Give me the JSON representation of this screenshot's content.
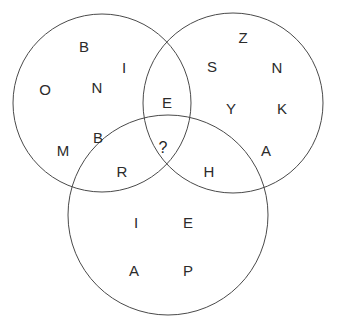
{
  "diagram": {
    "type": "venn",
    "background_color": "#ffffff",
    "stroke_color": "#4a4a4a",
    "text_color": "#2b2b2b",
    "circles": [
      {
        "id": "left",
        "label": "left-circle",
        "cx": 102,
        "cy": 103,
        "r": 89
      },
      {
        "id": "right",
        "label": "right-circle",
        "cx": 233,
        "cy": 103,
        "r": 90
      },
      {
        "id": "bottom",
        "label": "bottom-circle",
        "cx": 168,
        "cy": 215,
        "r": 100
      }
    ],
    "letters": [
      {
        "id": "l1",
        "text": "B",
        "x": 84,
        "y": 48,
        "region": "left-only"
      },
      {
        "id": "l2",
        "text": "I",
        "x": 124,
        "y": 69,
        "region": "left-only"
      },
      {
        "id": "l3",
        "text": "O",
        "x": 45,
        "y": 91,
        "region": "left-only"
      },
      {
        "id": "l4",
        "text": "N",
        "x": 97,
        "y": 89,
        "region": "left-only"
      },
      {
        "id": "l5",
        "text": "B",
        "x": 98,
        "y": 139,
        "region": "left-only"
      },
      {
        "id": "l6",
        "text": "M",
        "x": 63,
        "y": 152,
        "region": "left-only"
      },
      {
        "id": "r1",
        "text": "Z",
        "x": 243,
        "y": 39,
        "region": "right-only"
      },
      {
        "id": "r2",
        "text": "S",
        "x": 212,
        "y": 68,
        "region": "right-only"
      },
      {
        "id": "r3",
        "text": "N",
        "x": 277,
        "y": 69,
        "region": "right-only"
      },
      {
        "id": "r4",
        "text": "Y",
        "x": 231,
        "y": 110,
        "region": "right-only"
      },
      {
        "id": "r5",
        "text": "K",
        "x": 282,
        "y": 110,
        "region": "right-only"
      },
      {
        "id": "r6",
        "text": "A",
        "x": 266,
        "y": 152,
        "region": "right-only"
      },
      {
        "id": "b1",
        "text": "I",
        "x": 136,
        "y": 224,
        "region": "bottom-only"
      },
      {
        "id": "b2",
        "text": "E",
        "x": 188,
        "y": 224,
        "region": "bottom-only"
      },
      {
        "id": "b3",
        "text": "A",
        "x": 134,
        "y": 272,
        "region": "bottom-only"
      },
      {
        "id": "b4",
        "text": "P",
        "x": 188,
        "y": 272,
        "region": "bottom-only"
      },
      {
        "id": "lr",
        "text": "E",
        "x": 167,
        "y": 104,
        "region": "left-right-overlap"
      },
      {
        "id": "lb",
        "text": "R",
        "x": 122,
        "y": 173,
        "region": "left-bottom-overlap"
      },
      {
        "id": "rb",
        "text": "H",
        "x": 209,
        "y": 173,
        "region": "right-bottom-overlap"
      },
      {
        "id": "ctr",
        "text": "?",
        "x": 163,
        "y": 149,
        "region": "all-three-overlap",
        "unknown": true
      }
    ]
  }
}
